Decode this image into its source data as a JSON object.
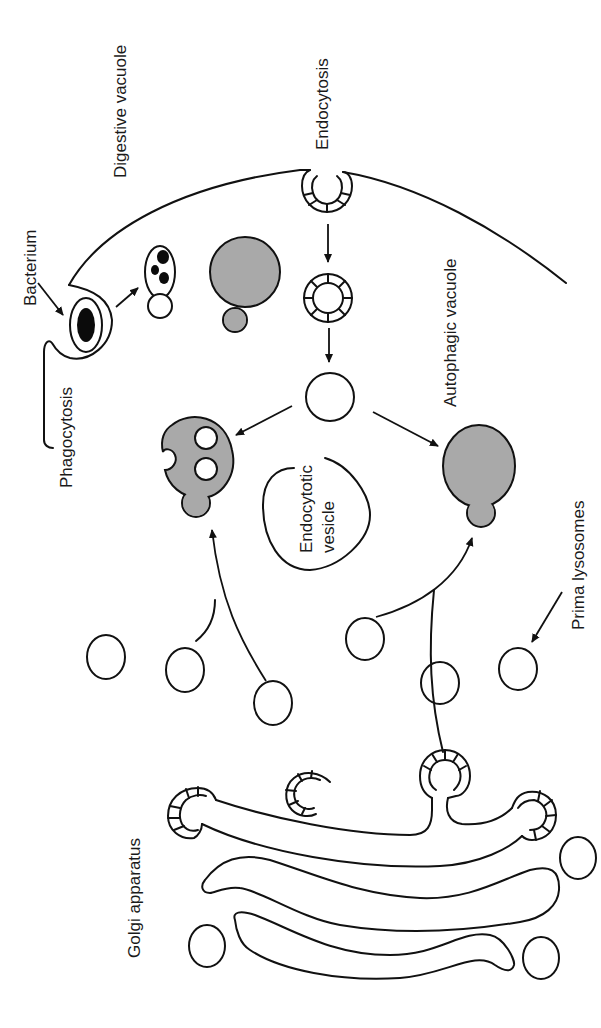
{
  "diagram": {
    "orientation": "rotated 90 degrees counter-clockwise (labels read bottom-to-top)",
    "labels": {
      "digestive_vacuole": "Digestive vacuole",
      "endocytosis": "Endocytosis",
      "bacterium": "Bacterium",
      "phagocytosis": "Phagocytosis",
      "autophagic_vacuole": "Autophagic vacuole",
      "endocytotic_vesicle_line1": "Endocytotic",
      "endocytotic_vesicle_line2": "vesicle",
      "prima_lysosomes": "Prima lysosomes",
      "golgi_apparatus": "Golgi apparatus"
    },
    "colors": {
      "stroke": "#111111",
      "secondary_lysosome_fill": "#a9a9a9",
      "bacterium_fill": "#0b0b0b",
      "background": "#ffffff"
    },
    "structures": [
      "cell membrane with phagocytic cup engulfing bacterium",
      "coated pit (endocytosis) budding from membrane",
      "coated vesicle",
      "uncoated endocytotic vesicle",
      "digestive vacuole with bacterial fragments",
      "gray secondary lysosome (digestive vacuole)",
      "gray residual body with two clear inclusions",
      "gray autophagic vacuole",
      "primary lysosomes (small circles)",
      "Golgi stack of three cisternae with coated buds"
    ]
  }
}
